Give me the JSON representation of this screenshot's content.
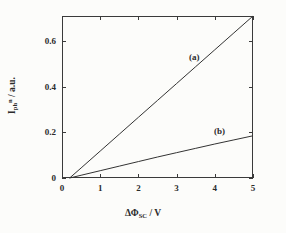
{
  "chart_data": {
    "type": "line",
    "title": "",
    "xlabel": "ΔΦSC / V",
    "ylabel": "Iph n / a.u.",
    "xlim": [
      0,
      5
    ],
    "ylim": [
      0,
      0.71
    ],
    "grid": false,
    "legend_position": "inline-annotations",
    "xticks": [
      0,
      1,
      2,
      3,
      4,
      5
    ],
    "xticklabels": [
      "0",
      "1",
      "2",
      "3",
      "4",
      "5"
    ],
    "yticks": [
      0,
      0.2,
      0.4,
      0.6
    ],
    "yticklabels": [
      "0",
      "0.2",
      "0.4",
      "0.6"
    ],
    "series": [
      {
        "name": "(a)",
        "label": "(a)",
        "color": "#333333",
        "x": [
          0.2,
          0.5,
          1.0,
          1.5,
          2.0,
          2.5,
          3.0,
          3.5,
          4.0,
          4.5,
          5.0
        ],
        "y": [
          0.0,
          0.044,
          0.118,
          0.192,
          0.266,
          0.34,
          0.414,
          0.488,
          0.562,
          0.636,
          0.71
        ]
      },
      {
        "name": "(b)",
        "label": "(b)",
        "color": "#333333",
        "x": [
          0.2,
          0.5,
          1.0,
          1.5,
          2.0,
          2.5,
          3.0,
          3.5,
          4.0,
          4.5,
          5.0
        ],
        "y": [
          0.0,
          0.012,
          0.032,
          0.052,
          0.072,
          0.092,
          0.111,
          0.13,
          0.149,
          0.167,
          0.185
        ]
      }
    ],
    "annotations": [
      {
        "text": "(a)",
        "x": 3.35,
        "y": 0.525
      },
      {
        "text": "(b)",
        "x": 4.0,
        "y": 0.215
      }
    ]
  },
  "axis": {
    "xlabel_main": "ΔΦ",
    "xlabel_sub": "SC",
    "xlabel_unit": " / V",
    "ylabel_main": "I",
    "ylabel_sub": "ph",
    "ylabel_sup": "n",
    "ylabel_unit": " /  a.u."
  },
  "colors": {
    "axis": "#3a3a3a",
    "curve": "#333333",
    "text": "#2b2b2b",
    "background": "#fcfcfa"
  }
}
